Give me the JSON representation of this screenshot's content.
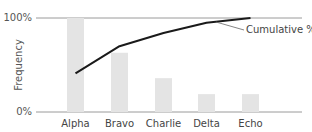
{
  "chart_data": {
    "type": "bar",
    "title": "",
    "xlabel": "",
    "ylabel": "Frequency",
    "ylim": [
      0,
      100
    ],
    "y_ticks": [
      "0%",
      "100%"
    ],
    "grid": false,
    "legend": null,
    "categories": [
      "Alpha",
      "Bravo",
      "Charlie",
      "Delta",
      "Echo"
    ],
    "series": [
      {
        "name": "Frequency",
        "type": "bar",
        "values": [
          100,
          63,
          36,
          19,
          19
        ],
        "color": "#e4e4e4"
      },
      {
        "name": "Cumulative %",
        "type": "line",
        "values": [
          41,
          70,
          84,
          95,
          100
        ],
        "color": "#1a1a1a"
      }
    ],
    "annotations": [
      {
        "text": "Cumulative %",
        "points_to": "line near Delta–Echo"
      }
    ]
  },
  "labels": {
    "y_top": "100%",
    "y_bottom": "0%",
    "y_axis_title": "Frequency",
    "annotation": "Cumulative %"
  }
}
